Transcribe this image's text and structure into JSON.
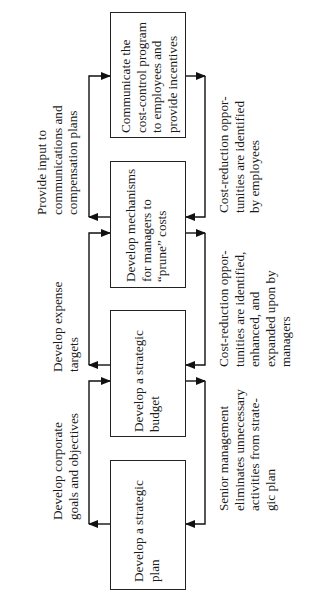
{
  "diagram": {
    "type": "flowchart",
    "orientation": "rotated-90-ccw",
    "steps": [
      {
        "id": "strategic-plan",
        "label": "Develop a strategic\nplan"
      },
      {
        "id": "strategic-budget",
        "label": "Develop a strategic\nbudget"
      },
      {
        "id": "prune-mechanisms",
        "label": "Develop mechanisms\nfor managers to\n“prune” costs"
      },
      {
        "id": "communicate",
        "label": "Communicate the\ncost-control program\nto employees and\nprovide incentives"
      }
    ],
    "top_labels": [
      {
        "between": [
          "strategic-plan",
          "strategic-budget"
        ],
        "text": "Develop corporate\ngoals and objectives"
      },
      {
        "between": [
          "strategic-budget",
          "prune-mechanisms"
        ],
        "text": "Develop expense\ntargets"
      },
      {
        "between": [
          "prune-mechanisms",
          "communicate"
        ],
        "text": "Provide input to\ncommunications and\ncompensation plans"
      }
    ],
    "bottom_labels": [
      {
        "between": [
          "strategic-plan",
          "strategic-budget"
        ],
        "text": "Senior management\neliminates unnecessary\nactivities from strate-\ngic plan"
      },
      {
        "between": [
          "strategic-budget",
          "prune-mechanisms"
        ],
        "text": "Cost-reduction oppor-\ntunities are identified,\nenhanced, and\nexpanded upon by\nmanagers"
      },
      {
        "between": [
          "prune-mechanisms",
          "communicate"
        ],
        "text": "Cost-reduction oppor-\ntunities are identified\nby employees"
      }
    ]
  }
}
